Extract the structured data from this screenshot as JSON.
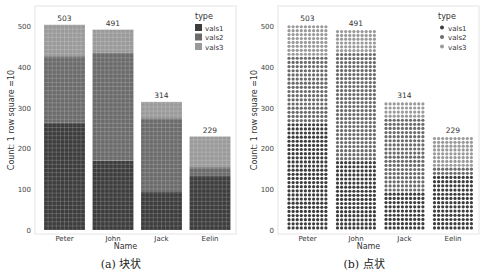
{
  "chart_data": [
    {
      "type": "bar",
      "subtype": "stacked waffle (squares)",
      "caption": "(a)  块状",
      "categories": [
        "Peter",
        "John",
        "Jack",
        "Eelin"
      ],
      "series": [
        {
          "name": "vals1",
          "values": [
            263,
            170,
            93,
            134
          ],
          "color": "#3d3d3d"
        },
        {
          "name": "vals2",
          "values": [
            163,
            265,
            181,
            20
          ],
          "color": "#6b6b6b"
        },
        {
          "name": "vals3",
          "values": [
            77,
            56,
            40,
            75
          ],
          "color": "#9a9a9a"
        }
      ],
      "totals": [
        503,
        491,
        314,
        229
      ],
      "xlabel": "Name",
      "ylabel": "Count: 1 row square =10",
      "yticks": [
        0,
        100,
        200,
        300,
        400,
        500
      ],
      "ylim": [
        0,
        540
      ],
      "legend": {
        "title": "type",
        "entries": [
          "vals1",
          "vals2",
          "vals3"
        ],
        "position": "top-right",
        "marker": "square"
      },
      "grid": false
    },
    {
      "type": "bar",
      "subtype": "stacked waffle (dots)",
      "caption": "(b)  点状",
      "categories": [
        "Peter",
        "John",
        "Jack",
        "Eelin"
      ],
      "series": [
        {
          "name": "vals1",
          "values": [
            263,
            170,
            93,
            134
          ],
          "color": "#3d3d3d"
        },
        {
          "name": "vals2",
          "values": [
            163,
            265,
            181,
            20
          ],
          "color": "#6b6b6b"
        },
        {
          "name": "vals3",
          "values": [
            77,
            56,
            40,
            75
          ],
          "color": "#9a9a9a"
        }
      ],
      "totals": [
        503,
        491,
        314,
        229
      ],
      "xlabel": "Name",
      "ylabel": "Count: 1 row square =10",
      "yticks": [
        0,
        100,
        200,
        300,
        400,
        500
      ],
      "ylim": [
        0,
        540
      ],
      "legend": {
        "title": "type",
        "entries": [
          "vals1",
          "vals2",
          "vals3"
        ],
        "position": "top-right",
        "marker": "dot"
      },
      "grid": false
    }
  ]
}
